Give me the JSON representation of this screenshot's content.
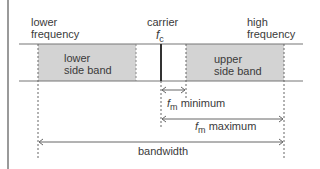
{
  "diagram": {
    "labels": {
      "lower_frequency": [
        "lower",
        "frequency"
      ],
      "carrier": "carrier",
      "fc_symbol": "f",
      "fc_sub": "c",
      "high_frequency": [
        "high",
        "frequency"
      ],
      "lower_side_band": [
        "lower",
        "side band"
      ],
      "upper_side_band": [
        "upper",
        "side band"
      ],
      "fm_symbol": "f",
      "fm_sub": "m",
      "fm_minimum": "minimum",
      "fm_maximum": "maximum",
      "bandwidth": "bandwidth"
    },
    "colors": {
      "band_fill": "#d3d3d3",
      "line": "#777777",
      "carrier_line": "#333333",
      "dashed": "#666666"
    }
  }
}
